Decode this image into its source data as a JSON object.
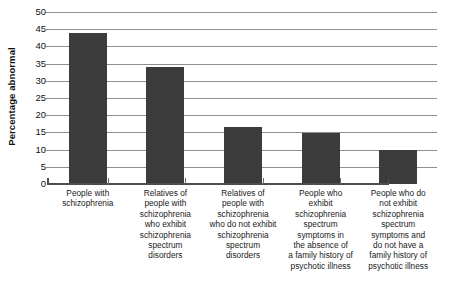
{
  "chart_data": {
    "type": "bar",
    "title": "",
    "subtitle": "",
    "xlabel": "",
    "ylabel": "Percentage abnormal",
    "ylim": [
      0,
      50
    ],
    "yticks": [
      0,
      5,
      10,
      15,
      20,
      25,
      30,
      35,
      40,
      45,
      50
    ],
    "ytick_labels": [
      "0",
      "5",
      "10",
      "15",
      "20",
      "25",
      "30",
      "35",
      "40",
      "45",
      "50"
    ],
    "grid": true,
    "legend": null,
    "orientation": "vertical",
    "bar_color": "#3b3b3b",
    "gridline_color": "#8e8e8e",
    "axis_color": "#4d4d4d",
    "background": "#ffffff",
    "categories": [
      "People with\nschizophrenia",
      "Relatives of\npeople with\nschizophrenia\nwho exhibit\nschizophrenia\nspectrum\ndisorders",
      "Relatives of\npeople with\nschizophrenia\nwho do not exhibit\nschizophrenia\nspectrum\ndisorders",
      "People who\nexhibit\nschizophrenia\nspectrum\nsymptoms in\nthe absence of\na family history of\npsychotic illness",
      "People who do\nnot exhibit\nschizophrenia\nspectrum\nsymptoms and\ndo not have a\nfamily history of\npsychotic illness"
    ],
    "values": [
      44,
      34,
      16.5,
      14.7,
      10
    ]
  }
}
